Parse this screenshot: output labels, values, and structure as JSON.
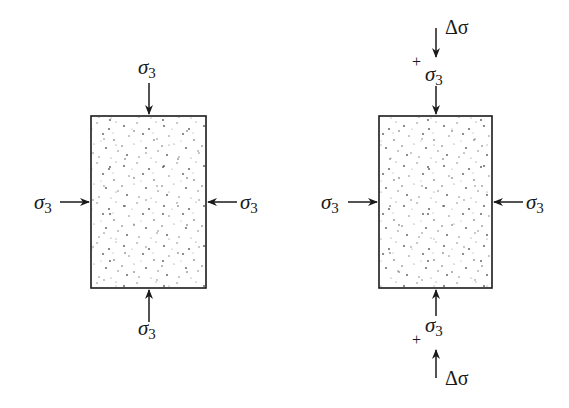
{
  "figure": {
    "colors": {
      "line": "#1a1a1a",
      "specimen_fill": "#ffffff",
      "speckle": "#555555"
    }
  },
  "left_specimen": {
    "top_label": {
      "symbol": "σ",
      "subscript": "3"
    },
    "bottom_label": {
      "symbol": "σ",
      "subscript": "3"
    },
    "left_label": {
      "symbol": "σ",
      "subscript": "3"
    },
    "right_label": {
      "symbol": "σ",
      "subscript": "3"
    }
  },
  "right_specimen": {
    "top_delta": "Δσ",
    "top_plus": "+",
    "top_label": {
      "symbol": "σ",
      "subscript": "3"
    },
    "bottom_label": {
      "symbol": "σ",
      "subscript": "3"
    },
    "bottom_plus": "+",
    "bottom_delta": "Δσ",
    "left_label": {
      "symbol": "σ",
      "subscript": "3"
    },
    "right_label": {
      "symbol": "σ",
      "subscript": "3"
    }
  }
}
